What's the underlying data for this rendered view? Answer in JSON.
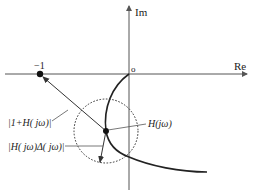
{
  "diagram": {
    "type": "nyquist-robustness-plot",
    "axes": {
      "real_label": "Re",
      "imag_label": "Im",
      "origin_label": "o"
    },
    "critical_point": {
      "label": "−1"
    },
    "labels": {
      "distance_to_critical": "|1+H( jω)|",
      "uncertainty_radius": "|H( jω)Δ( jω)|",
      "nyquist_point": "H(jω)"
    },
    "colors": {
      "axis": "#555555",
      "curve": "#222222",
      "circle": "#333333",
      "text": "#222222",
      "background": "#ffffff"
    }
  }
}
